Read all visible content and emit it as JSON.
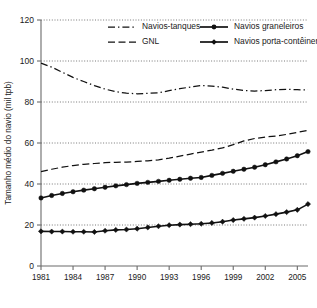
{
  "chart_data": {
    "type": "line",
    "title": "",
    "xlabel": "",
    "ylabel": "Tamanho médio do navio (mil tpb)",
    "xlim": [
      1981,
      2006
    ],
    "ylim": [
      0,
      120
    ],
    "yticks": [
      0,
      20,
      40,
      60,
      80,
      100,
      120
    ],
    "ytick_labels": [
      "0",
      "20",
      "40",
      "60",
      "80",
      "100",
      "120"
    ],
    "xticks": [
      1981,
      1984,
      1987,
      1990,
      1993,
      1996,
      1999,
      2002,
      2005
    ],
    "xtick_labels": [
      "1981",
      "1984",
      "1987",
      "1990",
      "1993",
      "1996",
      "1999",
      "2002",
      "2005"
    ],
    "grid": "horizontal-dotted",
    "legend_position": "top-inside",
    "x": [
      1981,
      1982,
      1983,
      1984,
      1985,
      1986,
      1987,
      1988,
      1989,
      1990,
      1991,
      1992,
      1993,
      1994,
      1995,
      1996,
      1997,
      1998,
      1999,
      2000,
      2001,
      2002,
      2003,
      2004,
      2005,
      2006
    ],
    "series": [
      {
        "name": "Navios-tanques",
        "style": "dash-dot",
        "marker": "none",
        "color": "#111111",
        "values": [
          99.0,
          97.0,
          94.5,
          92.0,
          90.0,
          88.0,
          86.3,
          85.0,
          84.3,
          84.0,
          84.2,
          84.5,
          85.5,
          86.5,
          87.3,
          88.0,
          87.8,
          87.2,
          86.3,
          85.6,
          85.3,
          85.6,
          86.0,
          86.2,
          86.0,
          85.9
        ]
      },
      {
        "name": "GNL",
        "style": "dashed",
        "marker": "none",
        "color": "#111111",
        "values": [
          46.0,
          47.2,
          48.2,
          49.0,
          49.6,
          50.0,
          50.4,
          50.6,
          50.7,
          51.0,
          51.3,
          51.8,
          52.6,
          53.6,
          54.6,
          55.6,
          56.5,
          57.6,
          59.2,
          61.0,
          62.2,
          62.9,
          63.4,
          64.2,
          65.2,
          66.2
        ]
      },
      {
        "name": "Navios graneleiros",
        "style": "solid",
        "marker": "circle",
        "color": "#111111",
        "values": [
          33.2,
          34.4,
          35.4,
          36.2,
          37.0,
          37.7,
          38.4,
          39.1,
          39.7,
          40.3,
          40.8,
          41.3,
          41.8,
          42.3,
          42.8,
          43.2,
          44.2,
          45.2,
          46.2,
          47.2,
          48.2,
          49.4,
          50.8,
          52.2,
          53.8,
          55.8
        ]
      },
      {
        "name": "Navios porta-contêineres",
        "style": "solid",
        "marker": "diamond",
        "color": "#111111",
        "values": [
          16.9,
          16.8,
          16.8,
          16.7,
          16.7,
          16.6,
          17.2,
          17.6,
          17.8,
          18.2,
          18.8,
          19.4,
          19.9,
          20.2,
          20.4,
          20.6,
          21.0,
          21.6,
          22.4,
          23.0,
          23.6,
          24.4,
          25.3,
          26.3,
          27.4,
          30.2
        ]
      }
    ]
  },
  "legend": {
    "items": [
      {
        "label": "Navios-tanques",
        "style": "dash-dot",
        "marker": "none"
      },
      {
        "label": "Navios graneleiros",
        "style": "solid",
        "marker": "circle"
      },
      {
        "label": "GNL",
        "style": "dashed",
        "marker": "none"
      },
      {
        "label": "Navios porta-contêineres",
        "style": "solid",
        "marker": "diamond"
      }
    ]
  }
}
